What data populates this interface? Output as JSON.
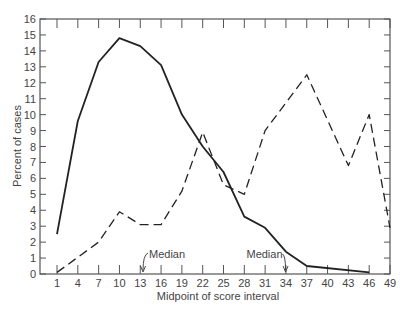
{
  "chart_data": {
    "type": "line",
    "title": "",
    "xlabel": "Midpoint of score interval",
    "ylabel": "Percent of cases",
    "x": [
      1,
      4,
      7,
      10,
      13,
      16,
      19,
      22,
      25,
      28,
      31,
      34,
      37,
      40,
      43,
      46,
      49
    ],
    "xticks": [
      "1",
      "4",
      "7",
      "10",
      "13",
      "16",
      "19",
      "22",
      "25",
      "28",
      "31",
      "34",
      "37",
      "40",
      "43",
      "46",
      "49"
    ],
    "yticks": [
      "0",
      "1",
      "2",
      "3",
      "4",
      "5",
      "6",
      "7",
      "8",
      "9",
      "10",
      "11",
      "12",
      "13",
      "14",
      "15",
      "16"
    ],
    "ylim": [
      0,
      16
    ],
    "xlim": [
      -1.5,
      49
    ],
    "grid": false,
    "legend": "none",
    "series": [
      {
        "name": "Solid line",
        "style": "solid",
        "points": [
          [
            1,
            2.5
          ],
          [
            4,
            9.6
          ],
          [
            7,
            13.3
          ],
          [
            10,
            14.8
          ],
          [
            13,
            14.3
          ],
          [
            16,
            13.1
          ],
          [
            19,
            10.0
          ],
          [
            22,
            8.0
          ],
          [
            25,
            6.4
          ],
          [
            28,
            3.6
          ],
          [
            31,
            2.9
          ],
          [
            34,
            1.4
          ],
          [
            37,
            0.5
          ],
          [
            46,
            0.1
          ]
        ]
      },
      {
        "name": "Dashed line",
        "style": "dashed",
        "points": [
          [
            1,
            0.1
          ],
          [
            7,
            2.0
          ],
          [
            10,
            3.9
          ],
          [
            13,
            3.1
          ],
          [
            16,
            3.1
          ],
          [
            19,
            5.2
          ],
          [
            22,
            8.9
          ],
          [
            25,
            5.6
          ],
          [
            28,
            5.0
          ],
          [
            31,
            9.0
          ],
          [
            37,
            12.5
          ],
          [
            43,
            6.8
          ],
          [
            46,
            10.0
          ],
          [
            49,
            2.9
          ]
        ]
      }
    ],
    "annotations": [
      {
        "text": "Median",
        "x": 13.4,
        "series": "Dashed line"
      },
      {
        "text": "Median",
        "x": 33.8,
        "series": "Solid line"
      }
    ]
  }
}
